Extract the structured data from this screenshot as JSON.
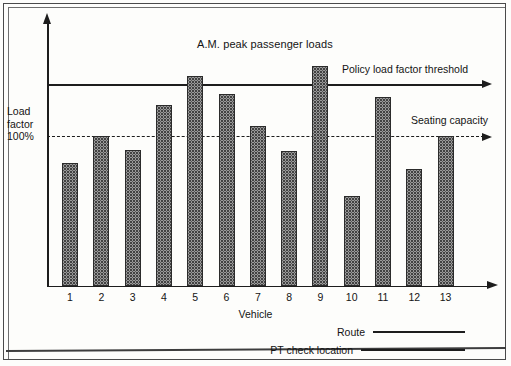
{
  "chart_data": {
    "type": "bar",
    "title": "A.M. peak passenger loads",
    "xlabel": "Vehicle",
    "ylabel": "Load factor 100%",
    "categories": [
      "1",
      "2",
      "3",
      "4",
      "5",
      "6",
      "7",
      "8",
      "9",
      "10",
      "11",
      "12",
      "13"
    ],
    "values": [
      82,
      100,
      91,
      121,
      140,
      128,
      107,
      90,
      147,
      60,
      126,
      78,
      100
    ],
    "ylim": [
      0,
      160
    ],
    "grid": false,
    "legend_position": "below-axis-right",
    "series": [
      {
        "name": "A.M. peak passenger loads",
        "values": [
          82,
          100,
          91,
          121,
          140,
          128,
          107,
          90,
          147,
          60,
          126,
          78,
          100
        ]
      }
    ],
    "reference_lines": [
      {
        "name": "Policy load factor threshold",
        "value": 133,
        "style": "solid"
      },
      {
        "name": "Seating capacity",
        "value": 100,
        "style": "dashed"
      }
    ],
    "annotations": [
      {
        "text": "Policy load factor threshold"
      },
      {
        "text": "Seating capacity"
      }
    ],
    "legend": [
      {
        "label": "Route",
        "style": "solid-line"
      },
      {
        "label": "PT check location",
        "style": "solid-line"
      }
    ]
  },
  "axis": {
    "y_label_line1": "Load",
    "y_label_line2": "factor",
    "y_label_line3": "100%",
    "x_title": "Vehicle"
  },
  "labels": {
    "title": "A.M. peak passenger loads",
    "policy_threshold": "Policy load factor threshold",
    "seating_capacity": "Seating capacity",
    "legend_route": "Route",
    "legend_pt_check": "PT check location"
  }
}
